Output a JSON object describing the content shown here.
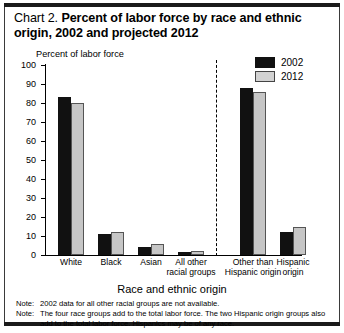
{
  "title": {
    "prefix": "Chart 2.",
    "main": "Percent of labor force by race and ethnic origin, 2002 and projected 2012"
  },
  "axes": {
    "y_title": "Percent of labor force",
    "x_title": "Race and ethnic origin",
    "y_ticks": [
      "0",
      "10",
      "20",
      "30",
      "40",
      "50",
      "60",
      "70",
      "80",
      "90",
      "100"
    ]
  },
  "legend": {
    "items": [
      {
        "label": "2002",
        "color": "#111111"
      },
      {
        "label": "2012",
        "color": "#c6c6c6"
      }
    ]
  },
  "categories": [
    {
      "line1": "White",
      "line2": ""
    },
    {
      "line1": "Black",
      "line2": ""
    },
    {
      "line1": "Asian",
      "line2": ""
    },
    {
      "line1": "All other",
      "line2": "racial groups"
    },
    {
      "line1": "Other than",
      "line2": "Hispanic origin"
    },
    {
      "line1": "Hispanic",
      "line2": "origin"
    }
  ],
  "notes": [
    {
      "label": "Note:",
      "text": "2002 data for all other racial groups are not available."
    },
    {
      "label": "Note:",
      "text": "The four race groups add to the total labor force. The two Hispanic origin groups also add to the total labor force. Hispanics may be of any race."
    }
  ],
  "chart_data": {
    "type": "bar",
    "title": "Chart 2. Percent of labor force by race and ethnic origin, 2002 and projected 2012",
    "xlabel": "Race and ethnic origin",
    "ylabel": "Percent of labor force",
    "ylim": [
      0,
      100
    ],
    "ytick_step": 10,
    "grid": false,
    "legend_position": "top-right",
    "categories": [
      "White",
      "Black",
      "Asian",
      "All other racial groups",
      "Other than Hispanic origin",
      "Hispanic origin"
    ],
    "series": [
      {
        "name": "2002",
        "color": "#111111",
        "values": [
          83,
          11,
          4,
          1.5,
          88,
          12
        ]
      },
      {
        "name": "2012",
        "color": "#c6c6c6",
        "values": [
          80,
          12,
          6,
          2,
          86,
          15
        ]
      }
    ],
    "annotations": [
      "dashed vertical divider separating race groups from Hispanic origin groups"
    ]
  }
}
